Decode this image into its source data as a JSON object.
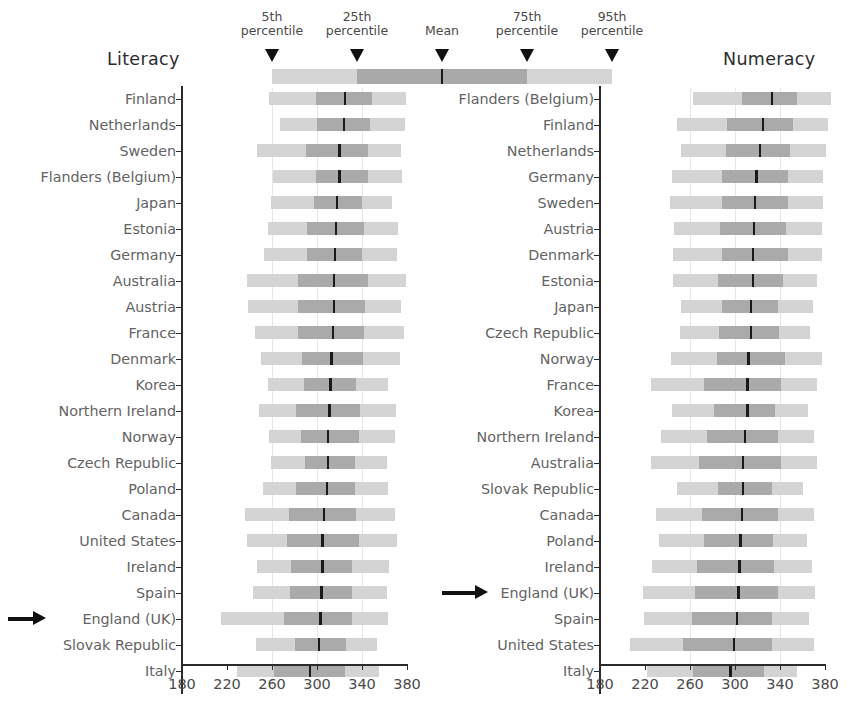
{
  "chart_data": {
    "type": "bar",
    "title": "",
    "subtitle": "",
    "panels": [
      {
        "name": "literacy",
        "title": "Literacy",
        "xlabel": "",
        "ylabel": "",
        "xlim": [
          180,
          380
        ],
        "xticks": [
          180,
          220,
          260,
          300,
          340,
          380
        ],
        "gridlines": [
          260,
          300,
          340
        ],
        "highlight": "England (UK)",
        "categories": [
          "Finland",
          "Netherlands",
          "Sweden",
          "Flanders (Belgium)",
          "Japan",
          "Estonia",
          "Germany",
          "Australia",
          "Austria",
          "France",
          "Denmark",
          "Korea",
          "Northern Ireland",
          "Norway",
          "Czech Republic",
          "Poland",
          "Canada",
          "United States",
          "Ireland",
          "Spain",
          "England (UK)",
          "Slovak Republic",
          "Italy"
        ],
        "series": [
          {
            "name": "5th percentile",
            "values": [
              257,
              267,
              247,
              261,
              259,
              256,
              253,
              238,
              239,
              245,
              250,
              256,
              248,
              257,
              259,
              252,
              236,
              238,
              247,
              243,
              215,
              246,
              229
            ]
          },
          {
            "name": "25th percentile",
            "values": [
              299,
              300,
              290,
              299,
              297,
              291,
              291,
              283,
              283,
              283,
              287,
              288,
              281,
              286,
              289,
              281,
              275,
              273,
              277,
              276,
              271,
              280,
              262
            ]
          },
          {
            "name": "Mean",
            "values": [
              325,
              324,
              320,
              320,
              318,
              317,
              316,
              315,
              315,
              314,
              313,
              312,
              311,
              310,
              310,
              309,
              306,
              305,
              305,
              304,
              303,
              302,
              294
            ]
          },
          {
            "name": "75th percentile",
            "values": [
              349,
              347,
              345,
              345,
              340,
              342,
              340,
              345,
              343,
              342,
              341,
              335,
              338,
              337,
              334,
              334,
              335,
              337,
              331,
              331,
              331,
              326,
              325
            ]
          },
          {
            "name": "95th percentile",
            "values": [
              379,
              378,
              375,
              376,
              367,
              372,
              371,
              379,
              375,
              377,
              374,
              363,
              370,
              369,
              362,
              363,
              369,
              371,
              364,
              362,
              363,
              353,
              355
            ]
          }
        ]
      },
      {
        "name": "numeracy",
        "title": "Numeracy",
        "xlabel": "",
        "ylabel": "",
        "xlim": [
          180,
          380
        ],
        "xticks": [
          180,
          220,
          260,
          300,
          340,
          380
        ],
        "gridlines": [
          260,
          300,
          340
        ],
        "highlight": "England (UK)",
        "categories": [
          "Flanders (Belgium)",
          "Finland",
          "Netherlands",
          "Germany",
          "Sweden",
          "Austria",
          "Denmark",
          "Estonia",
          "Japan",
          "Czech Republic",
          "Norway",
          "France",
          "Korea",
          "Northern Ireland",
          "Australia",
          "Slovak Republic",
          "Canada",
          "Poland",
          "Ireland",
          "England (UK)",
          "Spain",
          "United States",
          "Italy"
        ],
        "series": [
          {
            "name": "5th percentile",
            "values": [
              263,
              248,
              252,
              244,
              242,
              246,
              245,
              245,
              252,
              251,
              243,
              225,
              244,
              234,
              225,
              248,
              230,
              232,
              226,
              218,
              219,
              207,
              222
            ]
          },
          {
            "name": "25th percentile",
            "values": [
              306,
              293,
              292,
              288,
              288,
              287,
              288,
              285,
              288,
              286,
              284,
              272,
              281,
              275,
              268,
              285,
              271,
              272,
              266,
              264,
              262,
              254,
              263
            ]
          },
          {
            "name": "Mean",
            "values": [
              333,
              325,
              322,
              319,
              318,
              317,
              316,
              316,
              314,
              314,
              312,
              311,
              311,
              309,
              307,
              307,
              306,
              305,
              304,
              303,
              302,
              299,
              296
            ]
          },
          {
            "name": "75th percentile",
            "values": [
              355,
              352,
              349,
              347,
              347,
              345,
              347,
              343,
              338,
              339,
              344,
              341,
              336,
              338,
              341,
              333,
              338,
              334,
              335,
              338,
              333,
              333,
              326
            ]
          },
          {
            "name": "95th percentile",
            "values": [
              385,
              383,
              381,
              378,
              378,
              377,
              377,
              373,
              369,
              367,
              377,
              373,
              365,
              370,
              373,
              360,
              370,
              364,
              368,
              371,
              366,
              370,
              355
            ]
          }
        ]
      }
    ],
    "legend": {
      "items": [
        {
          "label_line1": "5th",
          "label_line2": "percentile"
        },
        {
          "label_line1": "25th",
          "label_line2": "percentile"
        },
        {
          "label_line1": "Mean",
          "label_line2": ""
        },
        {
          "label_line1": "75th",
          "label_line2": "percentile"
        },
        {
          "label_line1": "95th",
          "label_line2": "percentile"
        }
      ]
    },
    "colors": {
      "light_band": "#d4d4d4",
      "dark_band": "#aaaaaa",
      "mean_line": "#1a1a1a",
      "axis": "#2b2b2b",
      "label_text": "#636363",
      "title_text": "#2b2b2b",
      "gridline": "#e6e6e6"
    }
  }
}
